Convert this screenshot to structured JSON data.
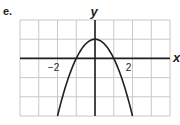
{
  "part_label": "e.",
  "chart_data": {
    "type": "line",
    "title": "",
    "xlabel": "x",
    "ylabel": "y",
    "xlim": [
      -4,
      4
    ],
    "ylim": [
      -3,
      2
    ],
    "grid": true,
    "grid_step": 1,
    "x_tick_labels": [
      {
        "value": -2,
        "label": "−2"
      },
      {
        "value": 2,
        "label": "2"
      }
    ],
    "series": [
      {
        "name": "y = 1 - x^2",
        "equation": "y = 1 - x^2",
        "vertex": [
          0,
          1
        ],
        "x_intercepts": [
          -1,
          1
        ],
        "x": [
          -2,
          -1.5,
          -1,
          -0.5,
          0,
          0.5,
          1,
          1.5,
          2
        ],
        "y": [
          -3,
          -1.25,
          0,
          0.75,
          1,
          0.75,
          0,
          -1.25,
          -3
        ]
      }
    ],
    "colors": {
      "grid": "#c8c8c8",
      "axis": "#231f20",
      "curve": "#231f20"
    }
  }
}
